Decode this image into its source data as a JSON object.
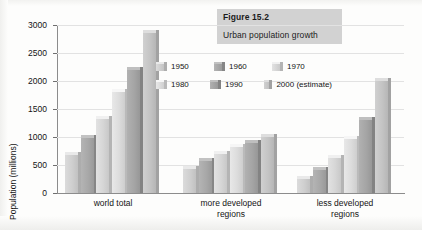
{
  "caption": {
    "figure_number": "Figure 15.2",
    "title": "Urban population growth"
  },
  "chart_data": {
    "type": "bar",
    "title": "Urban population growth",
    "xlabel": "",
    "ylabel": "Population (millions)",
    "ylim": [
      0,
      3000
    ],
    "ytick_labels": [
      "0",
      "500",
      "1000",
      "1500",
      "2000",
      "2500",
      "3000"
    ],
    "yticks": [
      0,
      500,
      1000,
      1500,
      2000,
      2500,
      3000
    ],
    "grid": true,
    "legend_position": "inside-upper-center",
    "categories": [
      "world total",
      "more developed regions",
      "less developed regions"
    ],
    "series": [
      {
        "name": "1950",
        "color": "#cfcfcf",
        "values": [
          680,
          430,
          250
        ]
      },
      {
        "name": "1960",
        "color": "#a8a8a8",
        "values": [
          980,
          570,
          410
        ]
      },
      {
        "name": "1970",
        "color": "#d6d6d6",
        "values": [
          1320,
          700,
          620
        ]
      },
      {
        "name": "1980",
        "color": "#dcdcdc",
        "values": [
          1800,
          830,
          970
        ]
      },
      {
        "name": "1990",
        "color": "#a5a5a5",
        "values": [
          2200,
          900,
          1300
        ]
      },
      {
        "name": "2000 (estimate)",
        "color": "#c4c4c4",
        "values": [
          2850,
          1000,
          2000
        ]
      }
    ],
    "legend_entries": [
      "1950",
      "1960",
      "1970",
      "1980",
      "1990",
      "2000 (estimate)"
    ]
  },
  "colors": {
    "caption_bg": "#d2d2d2",
    "axis": "#8c8c8c",
    "grid": "#e2e2e2",
    "text": "#141414"
  }
}
